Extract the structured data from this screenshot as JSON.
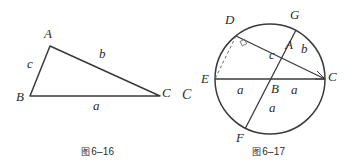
{
  "page": {
    "background": "#ffffff",
    "ink": "#3a3a3a",
    "width": 352,
    "height": 168
  },
  "figures": [
    {
      "id": "fig-6-16",
      "caption_mark": "图",
      "caption_text": "6–16",
      "kind": "triangle",
      "description": "Scalene triangle ABC with sides labelled a, b, c",
      "vertices": [
        {
          "label": "A",
          "x": 50,
          "y": 46,
          "label_x": 44,
          "label_y": 30
        },
        {
          "label": "B",
          "x": 30,
          "y": 96,
          "label_x": 17,
          "label_y": 92
        },
        {
          "label": "C",
          "x": 160,
          "y": 96,
          "label_x": 163,
          "label_y": 88
        }
      ],
      "side_labels": [
        {
          "label": "c",
          "x": 30,
          "y": 63
        },
        {
          "label": "b",
          "x": 101,
          "y": 52
        },
        {
          "label": "a",
          "x": 95,
          "y": 101
        }
      ]
    },
    {
      "id": "fig-6-17",
      "caption_mark": "图",
      "caption_text": "6–17",
      "kind": "circle-chords",
      "description": "Circle with centre B, diameter EC horizontal, chord GF through B, chord DC, dashed segment DE, right angle at D",
      "circle": {
        "cx": 270,
        "cy": 79,
        "r": 55
      },
      "points": [
        {
          "label": "D",
          "x": 236,
          "y": 36,
          "label_x": 228,
          "label_y": 20
        },
        {
          "label": "G",
          "x": 296,
          "y": 30,
          "label_x": 292,
          "label_y": 14
        },
        {
          "label": "A",
          "x": 288,
          "y": 48,
          "label_x": 287,
          "label_y": 39
        },
        {
          "label": "E",
          "x": 215,
          "y": 79,
          "label_x": 203,
          "label_y": 74
        },
        {
          "label": "B",
          "x": 270,
          "y": 79,
          "label_x": 272,
          "label_y": 85
        },
        {
          "label": "C",
          "x": 325,
          "y": 79,
          "label_x": 328,
          "label_y": 73
        },
        {
          "label": "F",
          "x": 245,
          "y": 129,
          "label_x": 238,
          "label_y": 136
        }
      ],
      "segment_labels": [
        {
          "label": "c",
          "x": 272,
          "y": 55
        },
        {
          "label": "b",
          "x": 303,
          "y": 49
        },
        {
          "label": "a",
          "x": 240,
          "y": 88
        },
        {
          "label": "a",
          "x": 294,
          "y": 88
        },
        {
          "label": "a",
          "x": 272,
          "y": 105
        }
      ],
      "stray_label": {
        "label": "C",
        "x": 186,
        "y": 94
      },
      "right_angle_at": "D"
    }
  ]
}
